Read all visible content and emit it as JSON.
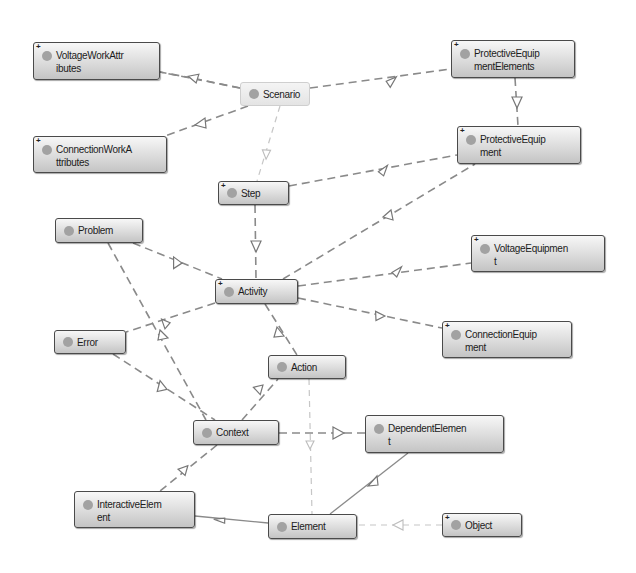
{
  "diagram": {
    "type": "class-dependency-graph",
    "nodes": [
      {
        "id": "voltage_work_attributes",
        "label": "VoltageWorkAttributes",
        "line1": "VoltageWorkAttr",
        "line2": "ibutes",
        "expandable": true
      },
      {
        "id": "scenario",
        "label": "Scenario",
        "expandable": false,
        "faded": true
      },
      {
        "id": "protective_equipment_elements",
        "label": "ProtectiveEquipmentElements",
        "line1": "ProtectiveEquip",
        "line2": "mentElements",
        "expandable": true
      },
      {
        "id": "connection_work_attributes",
        "label": "ConnectionWorkAttributes",
        "line1": "ConnectionWorkA",
        "line2": "ttributes",
        "expandable": true
      },
      {
        "id": "protective_equipment",
        "label": "ProtectiveEquipment",
        "line1": "ProtectiveEquip",
        "line2": "ment",
        "expandable": true
      },
      {
        "id": "step",
        "label": "Step",
        "expandable": true
      },
      {
        "id": "problem",
        "label": "Problem",
        "expandable": false
      },
      {
        "id": "activity",
        "label": "Activity",
        "expandable": true
      },
      {
        "id": "voltage_equipment",
        "label": "VoltageEquipment",
        "line1": "VoltageEquipmen",
        "line2": "t",
        "expandable": true
      },
      {
        "id": "error",
        "label": "Error",
        "expandable": false
      },
      {
        "id": "connection_equipment",
        "label": "ConnectionEquipment",
        "line1": "ConnectionEquip",
        "line2": "ment",
        "expandable": true
      },
      {
        "id": "action",
        "label": "Action",
        "expandable": false
      },
      {
        "id": "context",
        "label": "Context",
        "expandable": false
      },
      {
        "id": "dependent_element",
        "label": "DependentElement",
        "line1": "DependentElemen",
        "line2": "t",
        "expandable": false
      },
      {
        "id": "interactive_element",
        "label": "InteractiveElement",
        "line1": "InteractiveElem",
        "line2": "ent",
        "expandable": false
      },
      {
        "id": "element",
        "label": "Element",
        "expandable": false
      },
      {
        "id": "object",
        "label": "Object",
        "expandable": true
      }
    ],
    "edges": [
      {
        "from": "scenario",
        "to": "voltage_work_attributes",
        "style": "dashed"
      },
      {
        "from": "scenario",
        "to": "connection_work_attributes",
        "style": "dashed"
      },
      {
        "from": "scenario",
        "to": "protective_equipment_elements",
        "style": "dashed"
      },
      {
        "from": "scenario",
        "to": "step",
        "style": "dashed-light"
      },
      {
        "from": "protective_equipment_elements",
        "to": "protective_equipment",
        "style": "dashed"
      },
      {
        "from": "step",
        "to": "protective_equipment",
        "style": "dashed"
      },
      {
        "from": "step",
        "to": "activity",
        "style": "dashed"
      },
      {
        "from": "problem",
        "to": "activity",
        "style": "dashed"
      },
      {
        "from": "activity",
        "to": "protective_equipment",
        "style": "dashed"
      },
      {
        "from": "activity",
        "to": "voltage_equipment",
        "style": "dashed"
      },
      {
        "from": "activity",
        "to": "connection_equipment",
        "style": "dashed"
      },
      {
        "from": "activity",
        "to": "error",
        "style": "dashed"
      },
      {
        "from": "activity",
        "to": "action",
        "style": "dashed"
      },
      {
        "from": "problem",
        "to": "context",
        "style": "dashed"
      },
      {
        "from": "error",
        "to": "context",
        "style": "dashed"
      },
      {
        "from": "context",
        "to": "action",
        "style": "dashed"
      },
      {
        "from": "context",
        "to": "dependent_element",
        "style": "dashed"
      },
      {
        "from": "context",
        "to": "interactive_element",
        "style": "dashed"
      },
      {
        "from": "action",
        "to": "element",
        "style": "dashed-light"
      },
      {
        "from": "element",
        "to": "interactive_element",
        "style": "solid"
      },
      {
        "from": "element",
        "to": "dependent_element",
        "style": "solid"
      },
      {
        "from": "object",
        "to": "element",
        "style": "dashed-light"
      }
    ]
  },
  "colors": {
    "node_border": "#4a4a4a",
    "node_fill_top": "#f7f7f7",
    "node_fill_bottom": "#c4c4c4",
    "node_dot": "#a2a2a2",
    "edge": "#8a8a8a",
    "edge_light": "#c8c8c8",
    "background": "#ffffff"
  }
}
